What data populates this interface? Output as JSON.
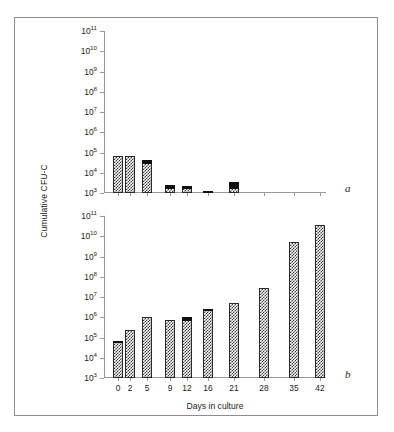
{
  "figure": {
    "y_axis_title": "Cumulative CFU-C",
    "x_axis_title": "Days in culture",
    "panel_a_letter": "a",
    "panel_b_letter": "b"
  },
  "axis": {
    "y_tick_labels": [
      {
        "base": "10",
        "exp": "3"
      },
      {
        "base": "10",
        "exp": "4"
      },
      {
        "base": "10",
        "exp": "5"
      },
      {
        "base": "10",
        "exp": "6"
      },
      {
        "base": "10",
        "exp": "7"
      },
      {
        "base": "10",
        "exp": "8"
      },
      {
        "base": "10",
        "exp": "9"
      },
      {
        "base": "10",
        "exp": "10"
      },
      {
        "base": "10",
        "exp": "11"
      }
    ],
    "x_tick_labels": [
      "0",
      "2",
      "5",
      "9",
      "12",
      "16",
      "21",
      "28",
      "35",
      "42"
    ]
  },
  "chart_data": {
    "type": "bar",
    "title": "",
    "subtitle": "",
    "xlabel": "Days in culture",
    "ylabel": "Cumulative CFU-C",
    "yscale": "log",
    "ylim": [
      1000,
      100000000000
    ],
    "grid": false,
    "legend": "none",
    "categories": [
      "0",
      "2",
      "5",
      "9",
      "12",
      "16",
      "21",
      "28",
      "35",
      "42"
    ],
    "panels": [
      {
        "id": "a",
        "label": "a",
        "ylabel": "Cumulative CFU-C",
        "ylim": [
          1000,
          100000000000
        ],
        "values": [
          70000,
          70000,
          45000,
          2600,
          2300,
          1080,
          3500,
          null,
          null,
          null
        ],
        "value_labels": [
          "7×10⁴",
          "7×10⁴",
          "4.5×10⁴",
          "2.6×10³",
          "2.3×10³",
          "1.1×10³",
          "3.5×10³",
          "",
          "",
          ""
        ],
        "black_cap_fraction": [
          0,
          0,
          0.12,
          0.55,
          0.45,
          0.8,
          0.62,
          0,
          0,
          0
        ]
      },
      {
        "id": "b",
        "label": "b",
        "ylabel": "Cumulative CFU-C",
        "ylim": [
          1000,
          100000000000
        ],
        "values": [
          70000,
          230000,
          1000000,
          700000,
          1000000,
          2600000,
          5000000,
          27000000,
          5000000000,
          35000000000
        ],
        "value_labels": [
          "7×10⁴",
          "2.3×10⁵",
          "1.0×10⁶",
          "7×10⁵",
          "1.0×10⁶",
          "2.6×10⁶",
          "5×10⁶",
          "2.7×10⁷",
          "5×10⁹",
          "3.5×10¹⁰"
        ],
        "black_cap_fraction": [
          0.035,
          0,
          0,
          0,
          0.06,
          0.02,
          0,
          0,
          0,
          0
        ]
      }
    ]
  }
}
